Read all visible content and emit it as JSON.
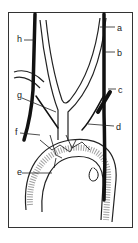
{
  "figure": {
    "type": "anatomical-line-drawing",
    "labels": [
      {
        "id": "a",
        "text": "a",
        "x": 117,
        "y": 24
      },
      {
        "id": "b",
        "text": "b",
        "x": 117,
        "y": 49
      },
      {
        "id": "c",
        "text": "c",
        "x": 118,
        "y": 86
      },
      {
        "id": "d",
        "text": "d",
        "x": 116,
        "y": 123
      },
      {
        "id": "e",
        "text": "e",
        "x": 17,
        "y": 170
      },
      {
        "id": "f",
        "text": "f",
        "x": 15,
        "y": 130
      },
      {
        "id": "g",
        "text": "g",
        "x": 17,
        "y": 91
      },
      {
        "id": "h",
        "text": "h",
        "x": 18,
        "y": 37
      }
    ]
  }
}
